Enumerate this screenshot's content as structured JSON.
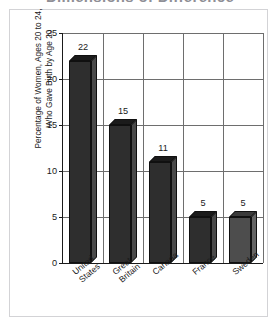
{
  "figure": {
    "title": "Dimensions of Difference"
  },
  "chart_data": {
    "type": "bar",
    "title": "Dimensions of Difference",
    "xlabel": "",
    "ylabel": "Percentage of Women, Ages 20 to 24,\nWho Gave Birth by Age 20",
    "categories": [
      "United\nStates",
      "Great\nBritain",
      "Canada",
      "France",
      "Sweden"
    ],
    "values": [
      22,
      15,
      11,
      5,
      5
    ],
    "value_labels": [
      "22",
      "15",
      "11",
      "5",
      "5"
    ],
    "ylim": [
      0,
      25
    ],
    "yticks": [
      0,
      5,
      10,
      15,
      20,
      25
    ],
    "ytick_labels": [
      "0",
      "5",
      "10",
      "15",
      "20",
      "25"
    ],
    "grid": true,
    "legend": null,
    "style": "3d-bar",
    "colors": {
      "bar_front": "#2e2e2e",
      "bar_top": "#1b1b1b",
      "bar_side": "#4a4a4a",
      "bar_front_light": "#4d4d4d",
      "axis": "#1a1a1a",
      "gridline": "#6e6e6e",
      "frame": "#d3d3d6",
      "background": "#ffffff"
    },
    "bar_shades": [
      "dark",
      "dark",
      "dark",
      "dark",
      "light"
    ]
  }
}
